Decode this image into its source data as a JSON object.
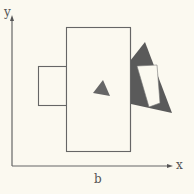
{
  "diagram": {
    "axes": {
      "x_label": "x",
      "y_label": "y",
      "bottom_label": "b"
    },
    "shapes": [
      {
        "name": "large-rectangle",
        "type": "rectangle",
        "fill": "#fbf9f0",
        "stroke": "#666666"
      },
      {
        "name": "small-rectangle",
        "type": "rectangle",
        "fill": "#fbf9f0",
        "stroke": "#666666"
      },
      {
        "name": "small-triangle",
        "type": "triangle",
        "fill": "#666666"
      },
      {
        "name": "large-triangle",
        "type": "triangle",
        "fill": "#5a5a5a"
      },
      {
        "name": "white-quadrilateral",
        "type": "quadrilateral",
        "fill": "#fbf9f0"
      }
    ],
    "colors": {
      "background": "#fbf9f0",
      "stroke": "#666666",
      "dark_fill": "#5a5a5a"
    }
  }
}
